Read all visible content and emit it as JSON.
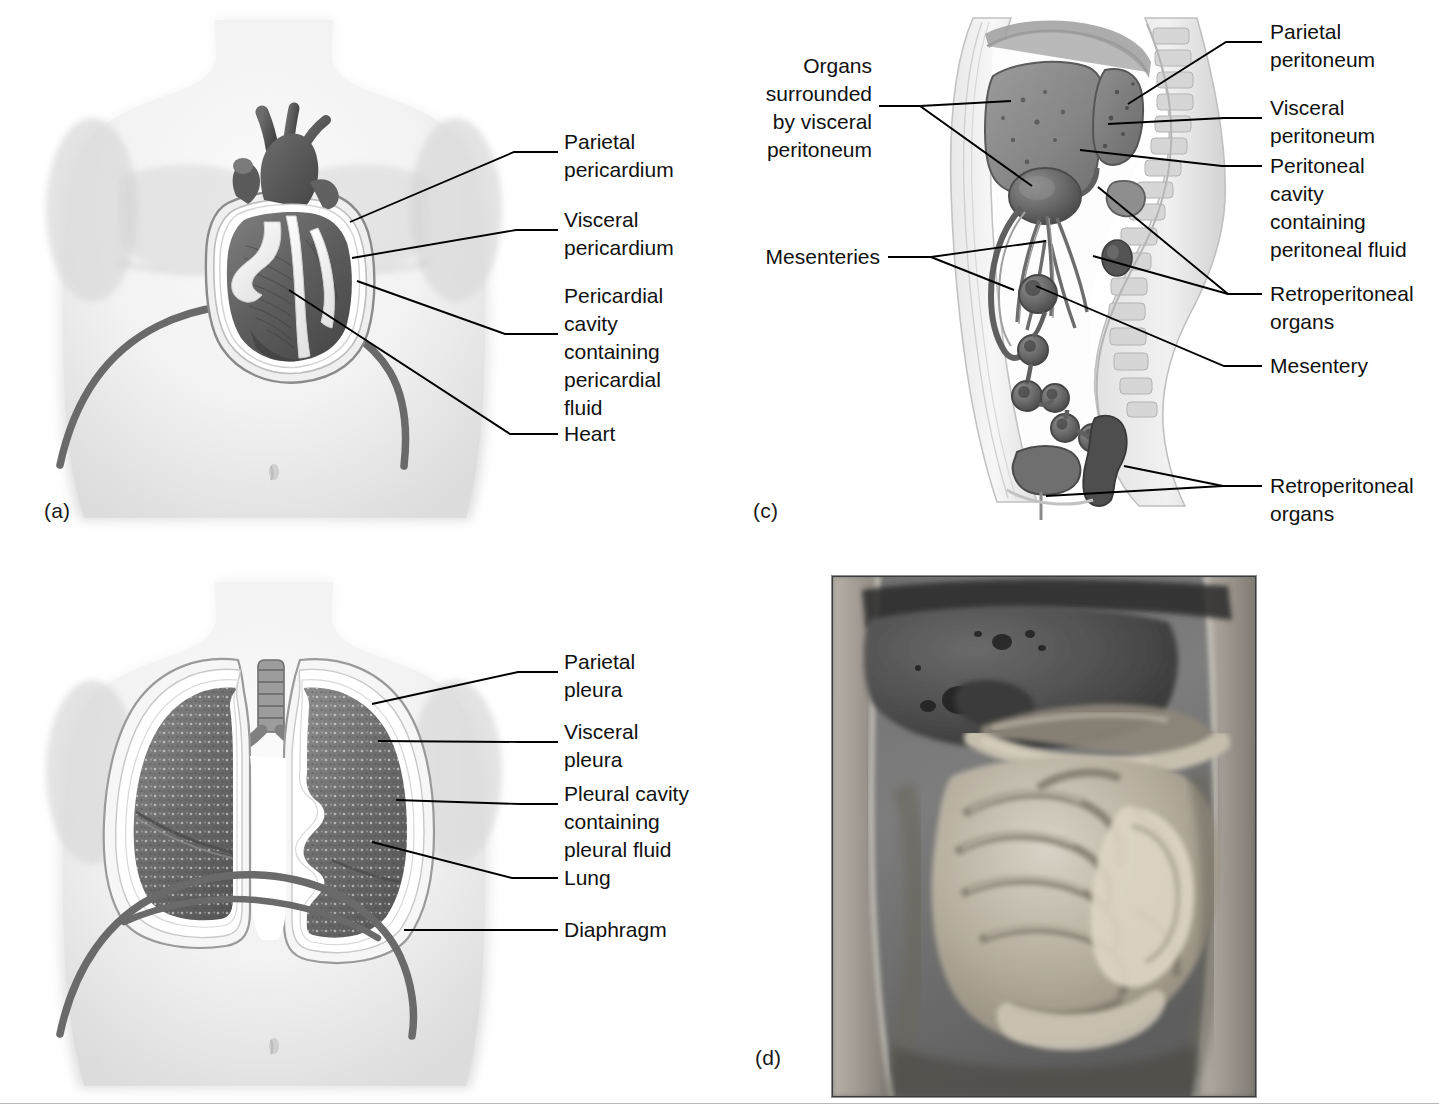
{
  "figure": {
    "background_color": "#ffffff",
    "text_color": "#111111",
    "rule_color": "#b9b9b9",
    "leader_color": "#000000"
  },
  "panels": [
    {
      "id": "a",
      "letter": "(a)",
      "subject": "Pericardium surrounding the heart in the thoracic cavity",
      "labels": [
        {
          "id": "parietal-pericardium",
          "text": "Parietal\npericardium"
        },
        {
          "id": "visceral-pericardium",
          "text": "Visceral\npericardium"
        },
        {
          "id": "pericardial-cavity",
          "text": "Pericardial\ncavity\ncontaining\npericardial\nfluid"
        },
        {
          "id": "heart",
          "text": "Heart"
        }
      ]
    },
    {
      "id": "b",
      "letter": "(b)",
      "subject": "Pleura surrounding the lungs in the thoracic cavity",
      "labels": [
        {
          "id": "parietal-pleura",
          "text": "Parietal\npleura"
        },
        {
          "id": "visceral-pleura",
          "text": "Visceral\npleura"
        },
        {
          "id": "pleural-cavity",
          "text": "Pleural cavity\ncontaining\npleural fluid"
        },
        {
          "id": "lung",
          "text": "Lung"
        },
        {
          "id": "diaphragm",
          "text": "Diaphragm"
        }
      ]
    },
    {
      "id": "c",
      "letter": "(c)",
      "subject": "Peritoneum and mesenteries of the abdominopelvic cavity, sagittal section",
      "labels_left": [
        {
          "id": "organs-visceral-peritoneum",
          "text": "Organs\nsurrounded\nby visceral\nperitoneum"
        },
        {
          "id": "mesenteries",
          "text": "Mesenteries"
        }
      ],
      "labels_right": [
        {
          "id": "parietal-peritoneum",
          "text": "Parietal\nperitoneum"
        },
        {
          "id": "visceral-peritoneum",
          "text": "Visceral\nperitoneum"
        },
        {
          "id": "peritoneal-cavity",
          "text": "Peritoneal\ncavity\ncontaining\nperitoneal fluid"
        },
        {
          "id": "retroperitoneal-organs-upper",
          "text": "Retroperitoneal\norgans"
        },
        {
          "id": "mesentery",
          "text": "Mesentery"
        },
        {
          "id": "retroperitoneal-organs-lower",
          "text": "Retroperitoneal\norgans"
        }
      ]
    },
    {
      "id": "d",
      "letter": "(d)",
      "subject": "Photograph of opened abdominal cavity showing peritoneum and abdominal viscera",
      "labels": []
    }
  ]
}
